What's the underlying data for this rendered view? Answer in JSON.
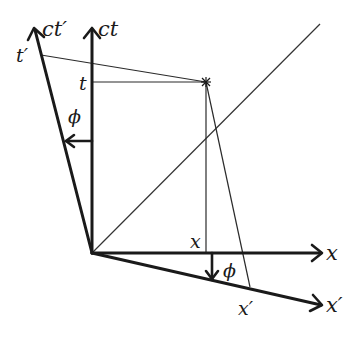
{
  "diagram": {
    "axes": {
      "ct": {
        "label": "ct",
        "from": [
          92,
          253
        ],
        "to": [
          92,
          28
        ]
      },
      "x": {
        "label": "x",
        "from": [
          92,
          253
        ],
        "to": [
          322,
          253
        ]
      },
      "ct_prime": {
        "label": "ct′",
        "from": [
          92,
          253
        ],
        "to": [
          34,
          28
        ]
      },
      "x_prime": {
        "label": "x′",
        "from": [
          92,
          253
        ],
        "to": [
          322,
          305
        ]
      }
    },
    "light_line": {
      "from": [
        92,
        253
      ],
      "to": [
        320,
        24
      ]
    },
    "event": {
      "position": [
        206,
        82
      ],
      "marker": "asterisk"
    },
    "projections": {
      "t_label": "t",
      "x_label": "x",
      "t_prime_label": "t′",
      "x_prime_label": "x′"
    },
    "angles": {
      "upper": {
        "label": "ϕ"
      },
      "lower": {
        "label": "ϕ"
      }
    },
    "colors": {
      "ink": "#1a1a1a",
      "background": "#ffffff"
    }
  }
}
